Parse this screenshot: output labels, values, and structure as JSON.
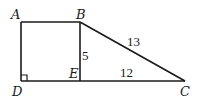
{
  "diagram": {
    "type": "geometry",
    "points": {
      "A": {
        "label": "A",
        "x": 21,
        "y": 22
      },
      "B": {
        "label": "B",
        "x": 80,
        "y": 22
      },
      "C": {
        "label": "C",
        "x": 185,
        "y": 81
      },
      "D": {
        "label": "D",
        "x": 21,
        "y": 81
      },
      "E": {
        "label": "E",
        "x": 80,
        "y": 81
      }
    },
    "segments": [
      "AB",
      "AD",
      "DC",
      "BE",
      "BC"
    ],
    "measures": {
      "BE": "5",
      "EC": "12",
      "BC": "13"
    },
    "right_angle_at": "D"
  }
}
